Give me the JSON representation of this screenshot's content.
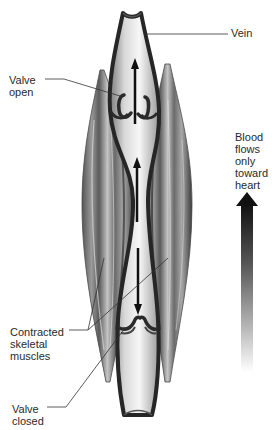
{
  "figure": {
    "type": "anatomical-diagram",
    "labels": {
      "vein": "Vein",
      "valve_open": "Valve\nopen",
      "blood_flow": "Blood\nflows\nonly\ntoward\nheart",
      "contracted_muscles": "Contracted\nskeletal\nmuscles",
      "valve_closed": "Valve\nclosed"
    },
    "arrows": [
      {
        "id": "upper-flow",
        "direction": "up",
        "meaning": "blood pushed upward through open valve"
      },
      {
        "id": "middle-flow",
        "direction": "up",
        "meaning": "blood squeezed upward by contracted muscles"
      },
      {
        "id": "lower-flow",
        "direction": "down",
        "meaning": "backflow stopped by closed valve"
      },
      {
        "id": "toward-heart",
        "direction": "up",
        "meaning": "overall flow direction toward heart",
        "style": "gradient black to white"
      }
    ],
    "colors": {
      "vein_wall": "#2b2b2b",
      "vein_lumen_light": "#f2f2f2",
      "vein_lumen_dark": "#8c8c8c",
      "muscle_dark": "#3a3a3a",
      "muscle_light": "#c8c8c8",
      "leader_line": "#333333",
      "arrow": "#111111"
    }
  }
}
